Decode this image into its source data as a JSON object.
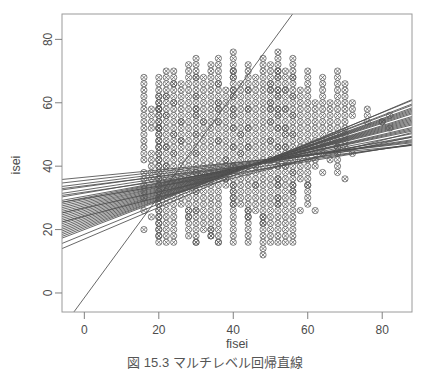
{
  "figure": {
    "caption": "図 15.3   マルチレベル回帰直線",
    "background_color": "#ffffff",
    "axis_color": "#808080",
    "point_color": "#555555",
    "line_color": "#4d4d4d"
  },
  "chart_data": {
    "type": "scatter",
    "title": "",
    "subtitle": "",
    "xlabel": "fisei",
    "ylabel": "isei",
    "xlim": [
      -6,
      88
    ],
    "ylim": [
      -6,
      88
    ],
    "xticks": [
      0,
      20,
      40,
      60,
      80
    ],
    "yticks": [
      0,
      20,
      40,
      60,
      80
    ],
    "grid": false,
    "legend": null,
    "marker": "circle-with-cross",
    "annotations": [],
    "x": [
      16,
      16,
      16,
      16,
      16,
      16,
      16,
      16,
      16,
      16,
      16,
      16,
      16,
      16,
      16,
      16,
      16,
      16,
      16,
      16,
      16,
      18,
      18,
      18,
      18,
      18,
      18,
      18,
      18,
      18,
      18,
      20,
      20,
      20,
      20,
      20,
      20,
      20,
      20,
      20,
      20,
      20,
      20,
      20,
      20,
      20,
      20,
      20,
      20,
      20,
      20,
      20,
      20,
      20,
      20,
      20,
      20,
      20,
      20,
      20,
      20,
      20,
      20,
      20,
      20,
      20,
      20,
      20,
      20,
      20,
      20,
      20,
      20,
      20,
      20,
      20,
      20,
      20,
      20,
      20,
      20,
      20,
      20,
      22,
      22,
      22,
      22,
      22,
      22,
      22,
      22,
      22,
      22,
      22,
      22,
      22,
      22,
      22,
      22,
      22,
      22,
      22,
      22,
      22,
      22,
      22,
      22,
      22,
      22,
      22,
      22,
      22,
      22,
      22,
      22,
      24,
      24,
      24,
      24,
      24,
      24,
      24,
      24,
      24,
      24,
      24,
      24,
      24,
      24,
      24,
      24,
      24,
      24,
      24,
      24,
      24,
      24,
      24,
      24,
      24,
      24,
      24,
      24,
      24,
      24,
      24,
      24,
      26,
      26,
      26,
      26,
      26,
      26,
      26,
      26,
      26,
      26,
      26,
      26,
      26,
      26,
      26,
      26,
      26,
      26,
      26,
      26,
      26,
      26,
      28,
      28,
      28,
      28,
      28,
      28,
      28,
      28,
      28,
      28,
      28,
      28,
      28,
      28,
      28,
      28,
      28,
      28,
      28,
      28,
      28,
      28,
      28,
      28,
      28,
      28,
      28,
      28,
      28,
      28,
      30,
      30,
      30,
      30,
      30,
      30,
      30,
      30,
      30,
      30,
      30,
      30,
      30,
      30,
      30,
      30,
      30,
      30,
      30,
      30,
      30,
      30,
      30,
      30,
      30,
      30,
      30,
      30,
      30,
      30,
      30,
      30,
      30,
      30,
      30,
      30,
      30,
      30,
      30,
      30,
      32,
      32,
      32,
      32,
      32,
      32,
      32,
      32,
      32,
      32,
      32,
      32,
      32,
      32,
      32,
      32,
      32,
      32,
      32,
      32,
      32,
      32,
      32,
      32,
      32,
      32,
      34,
      34,
      34,
      34,
      34,
      34,
      34,
      34,
      34,
      34,
      34,
      34,
      34,
      34,
      34,
      34,
      34,
      34,
      34,
      34,
      34,
      34,
      34,
      34,
      34,
      34,
      34,
      34,
      34,
      34,
      36,
      36,
      36,
      36,
      36,
      36,
      36,
      36,
      36,
      36,
      36,
      36,
      36,
      36,
      36,
      36,
      36,
      36,
      36,
      36,
      36,
      36,
      36,
      36,
      36,
      36,
      36,
      36,
      36,
      36,
      36,
      36,
      36,
      36,
      36,
      36,
      38,
      38,
      38,
      38,
      38,
      38,
      38,
      38,
      38,
      38,
      38,
      38,
      38,
      38,
      38,
      38,
      38,
      38,
      40,
      40,
      40,
      40,
      40,
      40,
      40,
      40,
      40,
      40,
      40,
      40,
      40,
      40,
      40,
      40,
      40,
      40,
      40,
      40,
      40,
      40,
      40,
      40,
      40,
      40,
      40,
      40,
      40,
      40,
      40,
      40,
      40,
      40,
      40,
      40,
      40,
      40,
      40,
      40,
      40,
      40,
      40,
      40,
      42,
      42,
      42,
      42,
      42,
      42,
      42,
      42,
      42,
      42,
      42,
      42,
      42,
      42,
      42,
      42,
      42,
      42,
      42,
      42,
      42,
      42,
      44,
      44,
      44,
      44,
      44,
      44,
      44,
      44,
      44,
      44,
      44,
      44,
      44,
      44,
      44,
      44,
      44,
      44,
      44,
      44,
      44,
      44,
      44,
      44,
      44,
      44,
      44,
      44,
      44,
      44,
      44,
      44,
      44,
      44,
      44,
      46,
      46,
      46,
      46,
      46,
      46,
      46,
      46,
      46,
      46,
      46,
      46,
      46,
      46,
      46,
      46,
      46,
      46,
      46,
      46,
      46,
      46,
      46,
      46,
      48,
      48,
      48,
      48,
      48,
      48,
      48,
      48,
      48,
      48,
      48,
      48,
      48,
      48,
      48,
      48,
      48,
      48,
      48,
      48,
      48,
      48,
      48,
      48,
      48,
      48,
      48,
      48,
      48,
      48,
      48,
      48,
      48,
      48,
      50,
      50,
      50,
      50,
      50,
      50,
      50,
      50,
      50,
      50,
      50,
      50,
      50,
      50,
      50,
      50,
      50,
      50,
      50,
      50,
      50,
      50,
      50,
      50,
      50,
      50,
      50,
      50,
      50,
      50,
      50,
      50,
      50,
      50,
      50,
      50,
      52,
      52,
      52,
      52,
      52,
      52,
      52,
      52,
      52,
      52,
      52,
      52,
      52,
      52,
      52,
      52,
      52,
      52,
      52,
      52,
      52,
      52,
      52,
      52,
      52,
      52,
      52,
      52,
      52,
      52,
      52,
      52,
      52,
      52,
      52,
      52,
      52,
      52,
      52,
      52,
      52,
      52,
      52,
      52,
      54,
      54,
      54,
      54,
      54,
      54,
      54,
      54,
      54,
      54,
      54,
      54,
      54,
      54,
      54,
      54,
      54,
      54,
      54,
      54,
      54,
      54,
      54,
      54,
      54,
      54,
      54,
      54,
      54,
      54,
      54,
      54,
      54,
      54,
      56,
      56,
      56,
      56,
      56,
      56,
      56,
      56,
      56,
      56,
      56,
      56,
      56,
      56,
      56,
      56,
      56,
      56,
      56,
      56,
      56,
      56,
      56,
      56,
      56,
      56,
      56,
      56,
      56,
      56,
      56,
      56,
      56,
      56,
      56,
      56,
      56,
      56,
      58,
      58,
      58,
      58,
      58,
      58,
      58,
      58,
      58,
      58,
      58,
      58,
      58,
      58,
      58,
      58,
      60,
      60,
      60,
      60,
      60,
      60,
      60,
      60,
      60,
      60,
      60,
      60,
      60,
      60,
      60,
      60,
      60,
      60,
      60,
      60,
      60,
      60,
      60,
      62,
      62,
      62,
      62,
      62,
      62,
      62,
      62,
      62,
      62,
      62,
      62,
      64,
      64,
      64,
      64,
      64,
      64,
      64,
      64,
      64,
      64,
      64,
      64,
      64,
      64,
      66,
      66,
      66,
      66,
      66,
      66,
      66,
      66,
      68,
      68,
      68,
      68,
      68,
      68,
      68,
      68,
      68,
      68,
      68,
      68,
      68,
      68,
      68,
      68,
      68,
      68,
      70,
      70,
      70,
      70,
      70,
      70,
      70,
      70,
      70,
      70,
      70,
      70,
      72,
      72,
      72,
      72,
      76,
      76,
      76,
      80,
      80,
      82,
      82
    ],
    "y": [
      42,
      44,
      46,
      48,
      50,
      52,
      54,
      56,
      58,
      60,
      62,
      64,
      66,
      68,
      38,
      36,
      34,
      32,
      30,
      26,
      20,
      52,
      54,
      56,
      58,
      44,
      42,
      40,
      38,
      36,
      24,
      62,
      60,
      58,
      56,
      54,
      52,
      50,
      48,
      46,
      44,
      42,
      40,
      38,
      36,
      34,
      32,
      30,
      28,
      26,
      24,
      22,
      20,
      18,
      68,
      66,
      64,
      62,
      60,
      58,
      56,
      54,
      52,
      50,
      48,
      46,
      44,
      42,
      40,
      38,
      36,
      34,
      32,
      30,
      28,
      26,
      24,
      22,
      20,
      18,
      16,
      58,
      52,
      46,
      40,
      66,
      64,
      62,
      60,
      58,
      56,
      54,
      52,
      50,
      48,
      46,
      44,
      42,
      40,
      38,
      36,
      34,
      32,
      30,
      28,
      26,
      24,
      22,
      20,
      18,
      16,
      70,
      68,
      62,
      56,
      50,
      44,
      70,
      68,
      66,
      64,
      62,
      60,
      58,
      56,
      54,
      52,
      50,
      48,
      46,
      44,
      42,
      40,
      38,
      36,
      34,
      32,
      30,
      28,
      26,
      24,
      22,
      20,
      18,
      16,
      66,
      60,
      54,
      48,
      66,
      64,
      62,
      60,
      58,
      56,
      54,
      52,
      50,
      48,
      46,
      44,
      42,
      40,
      38,
      36,
      34,
      32,
      30,
      28,
      26,
      24,
      72,
      70,
      68,
      66,
      64,
      62,
      60,
      58,
      56,
      54,
      52,
      50,
      48,
      46,
      44,
      42,
      40,
      38,
      36,
      34,
      32,
      30,
      28,
      26,
      24,
      22,
      20,
      18,
      16,
      58,
      74,
      72,
      70,
      68,
      66,
      64,
      62,
      60,
      58,
      56,
      54,
      52,
      50,
      48,
      46,
      44,
      42,
      40,
      38,
      36,
      34,
      32,
      30,
      28,
      26,
      24,
      22,
      20,
      18,
      16,
      68,
      62,
      56,
      50,
      44,
      38,
      32,
      26,
      20,
      54,
      68,
      66,
      64,
      62,
      60,
      58,
      56,
      54,
      52,
      50,
      48,
      46,
      44,
      42,
      40,
      38,
      36,
      34,
      32,
      30,
      28,
      26,
      24,
      22,
      20,
      18,
      72,
      70,
      68,
      66,
      64,
      62,
      60,
      58,
      56,
      54,
      52,
      50,
      48,
      46,
      44,
      42,
      40,
      38,
      36,
      34,
      32,
      30,
      28,
      26,
      24,
      22,
      20,
      18,
      16,
      58,
      74,
      72,
      70,
      68,
      66,
      64,
      62,
      60,
      58,
      56,
      54,
      52,
      50,
      48,
      46,
      44,
      42,
      40,
      38,
      36,
      34,
      32,
      30,
      28,
      26,
      24,
      22,
      20,
      18,
      16,
      66,
      60,
      54,
      48,
      42,
      36,
      64,
      62,
      60,
      58,
      56,
      54,
      52,
      50,
      48,
      46,
      44,
      42,
      40,
      38,
      36,
      34,
      32,
      30,
      76,
      74,
      72,
      70,
      68,
      66,
      64,
      62,
      60,
      58,
      56,
      54,
      52,
      50,
      48,
      46,
      44,
      42,
      40,
      38,
      36,
      34,
      32,
      30,
      28,
      26,
      24,
      22,
      20,
      18,
      16,
      70,
      64,
      58,
      52,
      46,
      40,
      34,
      28,
      68,
      62,
      56,
      50,
      44,
      66,
      64,
      62,
      60,
      58,
      56,
      54,
      52,
      50,
      48,
      46,
      44,
      42,
      40,
      38,
      36,
      34,
      32,
      30,
      28,
      26,
      24,
      72,
      70,
      68,
      66,
      64,
      62,
      60,
      58,
      56,
      54,
      52,
      50,
      48,
      46,
      44,
      42,
      40,
      38,
      36,
      34,
      32,
      30,
      28,
      26,
      24,
      22,
      20,
      18,
      16,
      64,
      58,
      52,
      46,
      40,
      34,
      68,
      66,
      64,
      62,
      60,
      58,
      56,
      54,
      52,
      50,
      48,
      46,
      44,
      42,
      40,
      38,
      36,
      34,
      32,
      30,
      28,
      26,
      24,
      22,
      74,
      72,
      70,
      68,
      66,
      64,
      62,
      60,
      58,
      56,
      54,
      52,
      50,
      48,
      46,
      44,
      42,
      40,
      38,
      36,
      34,
      32,
      30,
      28,
      26,
      24,
      22,
      20,
      18,
      16,
      14,
      12,
      64,
      58,
      72,
      70,
      68,
      66,
      64,
      62,
      60,
      58,
      56,
      54,
      52,
      50,
      48,
      46,
      44,
      42,
      40,
      38,
      36,
      34,
      32,
      30,
      28,
      26,
      24,
      22,
      20,
      18,
      16,
      66,
      60,
      54,
      48,
      42,
      36,
      30,
      76,
      74,
      72,
      70,
      68,
      66,
      64,
      62,
      60,
      58,
      56,
      54,
      52,
      50,
      48,
      46,
      44,
      42,
      40,
      38,
      36,
      34,
      32,
      30,
      28,
      26,
      24,
      22,
      20,
      18,
      16,
      70,
      64,
      58,
      52,
      46,
      40,
      34,
      28,
      68,
      62,
      56,
      50,
      70,
      68,
      66,
      64,
      62,
      60,
      58,
      56,
      54,
      52,
      50,
      48,
      46,
      44,
      42,
      40,
      38,
      36,
      34,
      32,
      30,
      28,
      26,
      24,
      22,
      20,
      18,
      16,
      64,
      58,
      52,
      46,
      40,
      34,
      74,
      72,
      70,
      68,
      66,
      64,
      62,
      60,
      58,
      56,
      54,
      52,
      50,
      48,
      46,
      44,
      42,
      40,
      38,
      36,
      34,
      32,
      30,
      28,
      26,
      24,
      22,
      20,
      18,
      16,
      68,
      62,
      56,
      50,
      44,
      38,
      32,
      26,
      64,
      62,
      60,
      58,
      56,
      54,
      52,
      50,
      48,
      46,
      44,
      42,
      40,
      38,
      36,
      34,
      70,
      68,
      66,
      64,
      62,
      60,
      58,
      56,
      54,
      52,
      50,
      48,
      46,
      44,
      42,
      40,
      38,
      36,
      34,
      32,
      30,
      28,
      26,
      60,
      58,
      56,
      54,
      52,
      50,
      48,
      46,
      44,
      42,
      40,
      38,
      68,
      66,
      64,
      62,
      60,
      58,
      56,
      54,
      52,
      50,
      48,
      46,
      44,
      42,
      60,
      58,
      56,
      54,
      52,
      50,
      48,
      46,
      70,
      68,
      66,
      64,
      62,
      60,
      58,
      56,
      54,
      52,
      50,
      48,
      46,
      44,
      42,
      40,
      38,
      36,
      66,
      64,
      62,
      60,
      58,
      56,
      54,
      52,
      50,
      48,
      46,
      44,
      60,
      58,
      56,
      54,
      58,
      56,
      54,
      54,
      52,
      56,
      54
    ],
    "fit_lines": [
      {
        "intercept": 36.5,
        "slope": 0.115
      },
      {
        "intercept": 35.5,
        "slope": 0.135
      },
      {
        "intercept": 34.5,
        "slope": 0.15
      },
      {
        "intercept": 33.5,
        "slope": 0.165
      },
      {
        "intercept": 32.5,
        "slope": 0.18
      },
      {
        "intercept": 31.5,
        "slope": 0.2
      },
      {
        "intercept": 30.5,
        "slope": 0.215
      },
      {
        "intercept": 30.0,
        "slope": 0.23
      },
      {
        "intercept": 29.5,
        "slope": 0.245
      },
      {
        "intercept": 29.0,
        "slope": 0.255
      },
      {
        "intercept": 28.5,
        "slope": 0.265
      },
      {
        "intercept": 28.0,
        "slope": 0.275
      },
      {
        "intercept": 27.5,
        "slope": 0.29
      },
      {
        "intercept": 27.0,
        "slope": 0.3
      },
      {
        "intercept": 26.5,
        "slope": 0.31
      },
      {
        "intercept": 26.0,
        "slope": 0.32
      },
      {
        "intercept": 25.5,
        "slope": 0.33
      },
      {
        "intercept": 25.0,
        "slope": 0.34
      },
      {
        "intercept": 24.5,
        "slope": 0.35
      },
      {
        "intercept": 24.0,
        "slope": 0.36
      },
      {
        "intercept": 23.5,
        "slope": 0.375
      },
      {
        "intercept": 23.0,
        "slope": 0.385
      },
      {
        "intercept": 22.5,
        "slope": 0.395
      },
      {
        "intercept": 22.0,
        "slope": 0.405
      },
      {
        "intercept": 21.5,
        "slope": 0.415
      },
      {
        "intercept": 21.0,
        "slope": 0.425
      },
      {
        "intercept": 20.5,
        "slope": 0.44
      },
      {
        "intercept": 20.0,
        "slope": 0.45
      },
      {
        "intercept": 24.2,
        "slope": 0.3
      },
      {
        "intercept": 26.8,
        "slope": 0.255
      },
      {
        "intercept": 29.8,
        "slope": 0.195
      },
      {
        "intercept": 31.8,
        "slope": 0.17
      },
      {
        "intercept": 33.8,
        "slope": 0.145
      },
      {
        "intercept": 18.5,
        "slope": 0.48
      },
      {
        "intercept": 17.0,
        "slope": 0.5
      },
      {
        "intercept": -1.5,
        "slope": 1.6
      }
    ]
  }
}
